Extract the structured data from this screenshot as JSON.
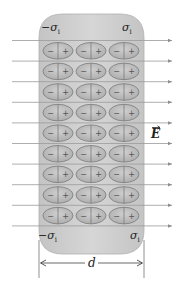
{
  "diagram": {
    "labels": {
      "sigma_top_left": "−σ",
      "sigma_top_left_sub": "i",
      "sigma_top_right": "σ",
      "sigma_top_right_sub": "i",
      "sigma_bottom_left": "−σ",
      "sigma_bottom_left_sub": "i",
      "sigma_bottom_right": "σ",
      "sigma_bottom_right_sub": "i",
      "field": "E",
      "width": "d"
    },
    "dipole": {
      "minus": "−",
      "plus": "+"
    },
    "dipole_rows": 9,
    "dipole_columns": 3,
    "field_lines": 10,
    "colors": {
      "slab_fill": "#cfcfcf",
      "slab_edge": "#b5b5b5",
      "dipole_fill": "#bdbdbd",
      "dipole_stroke": "#7a7a7a",
      "field_line": "#9a9a9a",
      "text": "#222222"
    }
  }
}
